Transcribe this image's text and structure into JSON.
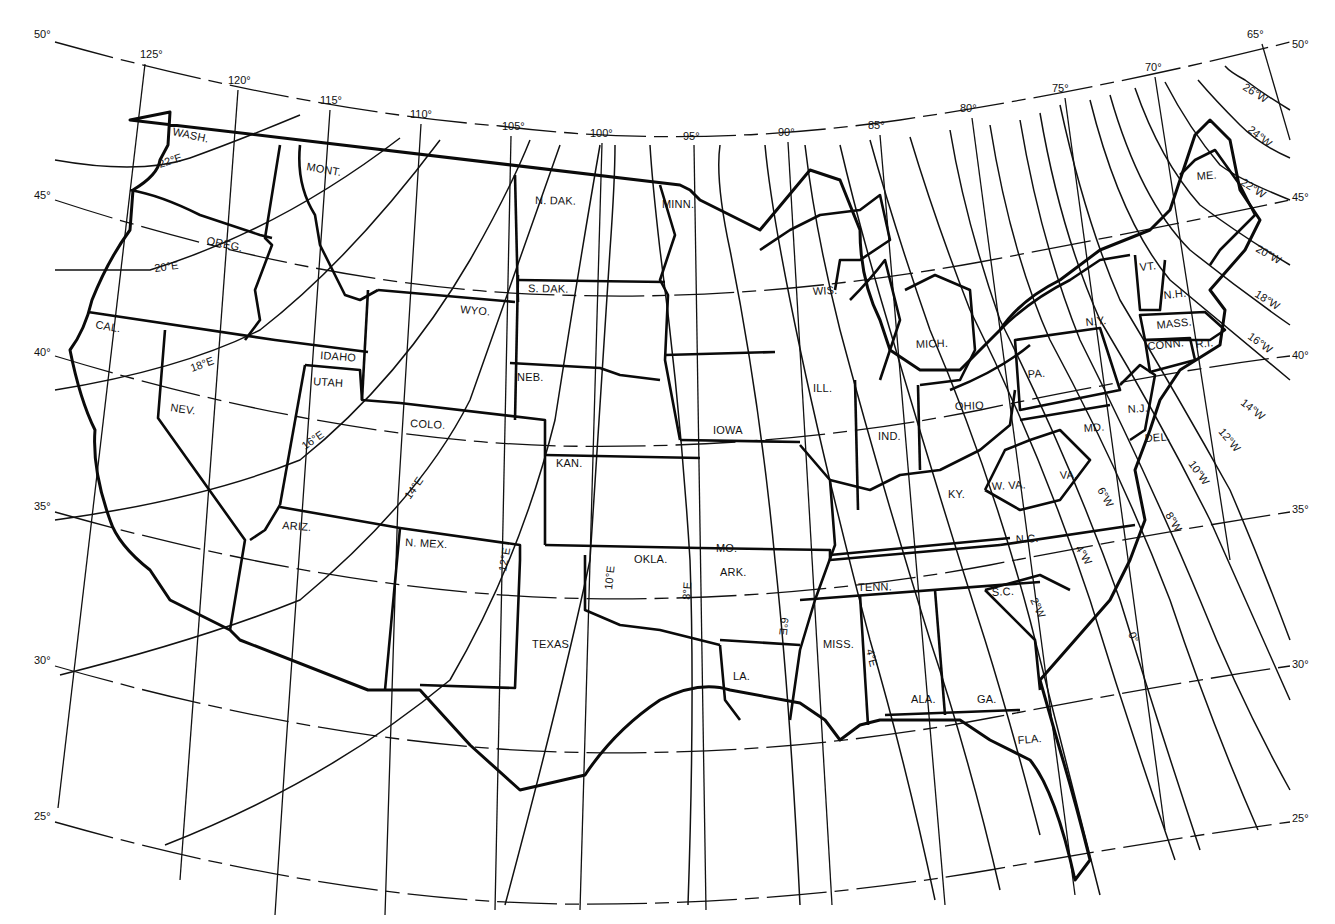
{
  "map": {
    "title": "Isogonic lines of magnetic declination, conterminous United States",
    "colors": {
      "ink": "#111111",
      "background": "#ffffff"
    },
    "latitude_labels": {
      "left": [
        {
          "label": "50°",
          "x": 34,
          "y": 38
        },
        {
          "label": "45°",
          "x": 34,
          "y": 199
        },
        {
          "label": "40°",
          "x": 34,
          "y": 356
        },
        {
          "label": "35°",
          "x": 34,
          "y": 510
        },
        {
          "label": "30°",
          "x": 34,
          "y": 664
        },
        {
          "label": "25°",
          "x": 34,
          "y": 820
        }
      ],
      "right": [
        {
          "label": "50°",
          "x": 1292,
          "y": 48
        },
        {
          "label": "45°",
          "x": 1292,
          "y": 201
        },
        {
          "label": "40°",
          "x": 1292,
          "y": 359
        },
        {
          "label": "35°",
          "x": 1292,
          "y": 513
        },
        {
          "label": "30°",
          "x": 1292,
          "y": 668
        },
        {
          "label": "25°",
          "x": 1292,
          "y": 822
        }
      ]
    },
    "longitude_labels": [
      {
        "label": "125°",
        "x": 140,
        "y": 58
      },
      {
        "label": "120°",
        "x": 228,
        "y": 84
      },
      {
        "label": "115°",
        "x": 320,
        "y": 104
      },
      {
        "label": "110°",
        "x": 410,
        "y": 118
      },
      {
        "label": "105°",
        "x": 502,
        "y": 130
      },
      {
        "label": "100°",
        "x": 590,
        "y": 137
      },
      {
        "label": "95°",
        "x": 683,
        "y": 140
      },
      {
        "label": "90°",
        "x": 778,
        "y": 136
      },
      {
        "label": "85°",
        "x": 868,
        "y": 129
      },
      {
        "label": "80°",
        "x": 960,
        "y": 112
      },
      {
        "label": "75°",
        "x": 1052,
        "y": 92
      },
      {
        "label": "70°",
        "x": 1145,
        "y": 71
      },
      {
        "label": "65°",
        "x": 1247,
        "y": 38
      }
    ],
    "isogonic_labels": [
      {
        "label": "22°E",
        "x": 160,
        "y": 168,
        "rotate": -18
      },
      {
        "label": "20°E",
        "x": 155,
        "y": 272,
        "rotate": -8
      },
      {
        "label": "18°E",
        "x": 192,
        "y": 372,
        "rotate": -20
      },
      {
        "label": "16°E",
        "x": 305,
        "y": 450,
        "rotate": -35
      },
      {
        "label": "14°E",
        "x": 410,
        "y": 500,
        "rotate": -55
      },
      {
        "label": "12°E",
        "x": 506,
        "y": 572,
        "rotate": -80
      },
      {
        "label": "10°E",
        "x": 612,
        "y": 590,
        "rotate": -84
      },
      {
        "label": "8°E",
        "x": 690,
        "y": 600,
        "rotate": -86
      },
      {
        "label": "6°E",
        "x": 781,
        "y": 617,
        "rotate": 96
      },
      {
        "label": "4°E",
        "x": 866,
        "y": 650,
        "rotate": 76
      },
      {
        "label": "0°",
        "x": 1128,
        "y": 634,
        "rotate": 66
      },
      {
        "label": "2°W",
        "x": 1030,
        "y": 600,
        "rotate": 64
      },
      {
        "label": "4°W",
        "x": 1075,
        "y": 548,
        "rotate": 58
      },
      {
        "label": "6°W",
        "x": 1097,
        "y": 490,
        "rotate": 60
      },
      {
        "label": "8°W",
        "x": 1165,
        "y": 515,
        "rotate": 58
      },
      {
        "label": "10°W",
        "x": 1188,
        "y": 464,
        "rotate": 54
      },
      {
        "label": "12°W",
        "x": 1218,
        "y": 432,
        "rotate": 50
      },
      {
        "label": "14°W",
        "x": 1240,
        "y": 404,
        "rotate": 38
      },
      {
        "label": "16°W",
        "x": 1247,
        "y": 338,
        "rotate": 36
      },
      {
        "label": "18°W",
        "x": 1254,
        "y": 296,
        "rotate": 32
      },
      {
        "label": "20°W",
        "x": 1255,
        "y": 251,
        "rotate": 30
      },
      {
        "label": "22°W",
        "x": 1240,
        "y": 184,
        "rotate": 33
      },
      {
        "label": "24°W",
        "x": 1247,
        "y": 131,
        "rotate": 38
      },
      {
        "label": "26°W",
        "x": 1242,
        "y": 89,
        "rotate": 32
      }
    ],
    "states": [
      {
        "label": "WASH.",
        "x": 172,
        "y": 135,
        "rotate": 12
      },
      {
        "label": "MONT.",
        "x": 306,
        "y": 170,
        "rotate": 10
      },
      {
        "label": "OREG.",
        "x": 206,
        "y": 244,
        "rotate": 12
      },
      {
        "label": "CAL.",
        "x": 95,
        "y": 328,
        "rotate": 10
      },
      {
        "label": "IDAHO",
        "x": 320,
        "y": 359,
        "rotate": 4
      },
      {
        "label": "UTAH",
        "x": 313,
        "y": 385,
        "rotate": 4
      },
      {
        "label": "NEV.",
        "x": 170,
        "y": 411,
        "rotate": 8
      },
      {
        "label": "WYO.",
        "x": 460,
        "y": 313,
        "rotate": 5
      },
      {
        "label": "COLO.",
        "x": 410,
        "y": 427,
        "rotate": 3
      },
      {
        "label": "ARIZ.",
        "x": 282,
        "y": 529,
        "rotate": 4
      },
      {
        "label": "N. MEX.",
        "x": 405,
        "y": 546,
        "rotate": 3
      },
      {
        "label": "N. DAK.",
        "x": 535,
        "y": 204,
        "rotate": 1
      },
      {
        "label": "S. DAK.",
        "x": 528,
        "y": 292,
        "rotate": 1
      },
      {
        "label": "NEB.",
        "x": 517,
        "y": 381,
        "rotate": 0
      },
      {
        "label": "KAN.",
        "x": 556,
        "y": 467,
        "rotate": 0
      },
      {
        "label": "OKLA.",
        "x": 634,
        "y": 563,
        "rotate": 0
      },
      {
        "label": "TEXAS",
        "x": 532,
        "y": 648,
        "rotate": 0
      },
      {
        "label": "MINN.",
        "x": 662,
        "y": 208,
        "rotate": 0
      },
      {
        "label": "IOWA",
        "x": 713,
        "y": 434,
        "rotate": 0
      },
      {
        "label": "MO.",
        "x": 716,
        "y": 552,
        "rotate": 0
      },
      {
        "label": "ARK.",
        "x": 720,
        "y": 576,
        "rotate": 0
      },
      {
        "label": "LA.",
        "x": 733,
        "y": 680,
        "rotate": 0
      },
      {
        "label": "WIS.",
        "x": 813,
        "y": 295,
        "rotate": -3
      },
      {
        "label": "ILL.",
        "x": 813,
        "y": 392,
        "rotate": 0
      },
      {
        "label": "MICH.",
        "x": 916,
        "y": 348,
        "rotate": -2
      },
      {
        "label": "IND.",
        "x": 878,
        "y": 440,
        "rotate": 0
      },
      {
        "label": "OHIO",
        "x": 955,
        "y": 410,
        "rotate": -2
      },
      {
        "label": "KY.",
        "x": 948,
        "y": 498,
        "rotate": 0
      },
      {
        "label": "W. VA.",
        "x": 992,
        "y": 490,
        "rotate": -3
      },
      {
        "label": "TENN.",
        "x": 858,
        "y": 591,
        "rotate": -1
      },
      {
        "label": "MISS.",
        "x": 823,
        "y": 648,
        "rotate": 0
      },
      {
        "label": "ALA.",
        "x": 911,
        "y": 703,
        "rotate": 0
      },
      {
        "label": "GA.",
        "x": 977,
        "y": 703,
        "rotate": 0
      },
      {
        "label": "FLA.",
        "x": 1018,
        "y": 744,
        "rotate": -5
      },
      {
        "label": "S.C.",
        "x": 992,
        "y": 596,
        "rotate": -3
      },
      {
        "label": "N.C.",
        "x": 1016,
        "y": 543,
        "rotate": -3
      },
      {
        "label": "VA.",
        "x": 1060,
        "y": 479,
        "rotate": -3
      },
      {
        "label": "MD.",
        "x": 1084,
        "y": 432,
        "rotate": -4
      },
      {
        "label": "DEL.",
        "x": 1145,
        "y": 442,
        "rotate": -4
      },
      {
        "label": "N.J.",
        "x": 1128,
        "y": 413,
        "rotate": -4
      },
      {
        "label": "PA.",
        "x": 1028,
        "y": 378,
        "rotate": -4
      },
      {
        "label": "N.Y.",
        "x": 1086,
        "y": 326,
        "rotate": -6
      },
      {
        "label": "VT.",
        "x": 1140,
        "y": 271,
        "rotate": -6
      },
      {
        "label": "N.H.",
        "x": 1164,
        "y": 299,
        "rotate": -6
      },
      {
        "label": "MASS.",
        "x": 1157,
        "y": 329,
        "rotate": -6
      },
      {
        "label": "CONN.",
        "x": 1148,
        "y": 350,
        "rotate": -6
      },
      {
        "label": "R.I.",
        "x": 1196,
        "y": 348,
        "rotate": -6
      },
      {
        "label": "ME.",
        "x": 1197,
        "y": 180,
        "rotate": -4
      }
    ]
  }
}
